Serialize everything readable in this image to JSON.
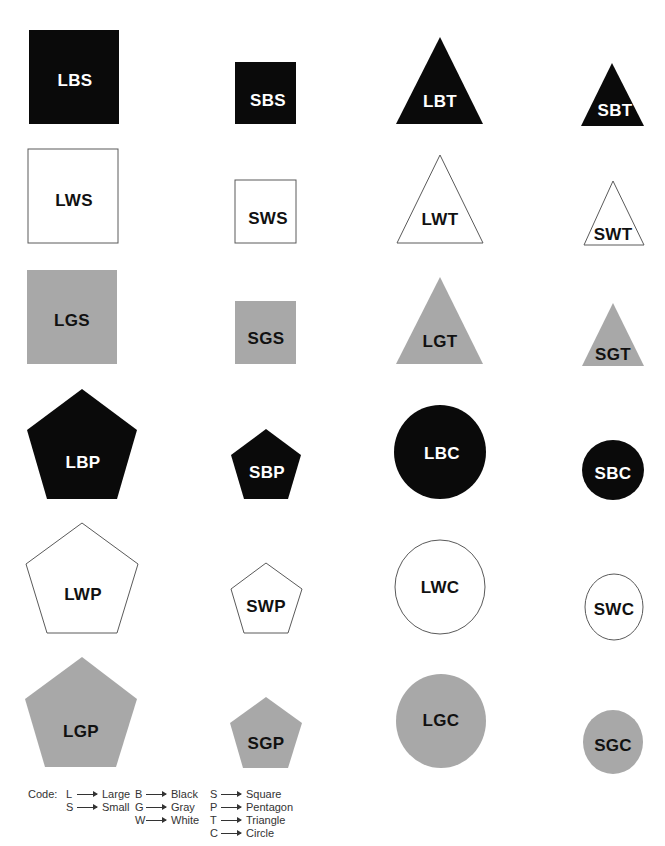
{
  "colors": {
    "black": "#0a0a0a",
    "gray": "#a8a8a8",
    "white": "#ffffff",
    "outline": "#5a5a5a",
    "label_on_dark": "#ffffff",
    "label_on_light": "#111111"
  },
  "shapes": [
    {
      "label": "LBS",
      "kind": "rect",
      "fill": "black",
      "x": 29,
      "y": 30,
      "w": 90,
      "h": 94,
      "lx": 75,
      "ly": 80
    },
    {
      "label": "SBS",
      "kind": "rect",
      "fill": "black",
      "x": 235,
      "y": 62,
      "w": 61,
      "h": 62,
      "lx": 268,
      "ly": 100
    },
    {
      "label": "LBT",
      "kind": "poly",
      "fill": "black",
      "points": "440,37 483,124 396,124",
      "lx": 440,
      "ly": 101
    },
    {
      "label": "SBT",
      "kind": "poly",
      "fill": "black",
      "points": "612,63 644,126 581,126",
      "lx": 615,
      "ly": 110
    },
    {
      "label": "LWS",
      "kind": "rect",
      "fill": "white",
      "x": 28,
      "y": 149,
      "w": 90,
      "h": 94,
      "lx": 74,
      "ly": 200
    },
    {
      "label": "SWS",
      "kind": "rect",
      "fill": "white",
      "x": 235,
      "y": 180,
      "w": 61,
      "h": 63,
      "lx": 268,
      "ly": 218
    },
    {
      "label": "LWT",
      "kind": "poly",
      "fill": "white",
      "points": "440,155 483,243 397,243",
      "lx": 440,
      "ly": 219
    },
    {
      "label": "SWT",
      "kind": "poly",
      "fill": "white",
      "points": "613,181 644,245 584,245",
      "lx": 613,
      "ly": 234
    },
    {
      "label": "LGS",
      "kind": "rect",
      "fill": "gray",
      "x": 27,
      "y": 270,
      "w": 90,
      "h": 94,
      "lx": 72,
      "ly": 320
    },
    {
      "label": "SGS",
      "kind": "rect",
      "fill": "gray",
      "x": 235,
      "y": 301,
      "w": 61,
      "h": 63,
      "lx": 266,
      "ly": 338
    },
    {
      "label": "LGT",
      "kind": "poly",
      "fill": "gray",
      "points": "440,277 483,364 396,364",
      "lx": 440,
      "ly": 341
    },
    {
      "label": "SGT",
      "kind": "poly",
      "fill": "gray",
      "points": "613,303 644,366 582,366",
      "lx": 613,
      "ly": 354
    },
    {
      "label": "LBP",
      "kind": "poly",
      "fill": "black",
      "points": "82,389 137,430 117,499 47,499 27,430",
      "lx": 83,
      "ly": 462
    },
    {
      "label": "SBP",
      "kind": "poly",
      "fill": "black",
      "points": "266,429 301,455 288,499 244,499 231,455",
      "lx": 267,
      "ly": 472
    },
    {
      "label": "LBC",
      "kind": "ellipse",
      "fill": "black",
      "cx": 440,
      "cy": 452,
      "rx": 46,
      "ry": 47,
      "lx": 442,
      "ly": 453
    },
    {
      "label": "SBC",
      "kind": "ellipse",
      "fill": "black",
      "cx": 613,
      "cy": 470,
      "rx": 31,
      "ry": 30,
      "lx": 613,
      "ly": 473
    },
    {
      "label": "LWP",
      "kind": "poly",
      "fill": "white",
      "points": "82,523 138,564 117,633 47,633 26,564",
      "lx": 83,
      "ly": 594
    },
    {
      "label": "SWP",
      "kind": "poly",
      "fill": "white",
      "points": "266,563 302,589 288,633 244,633 231,589",
      "lx": 266,
      "ly": 606
    },
    {
      "label": "LWC",
      "kind": "ellipse",
      "fill": "white",
      "cx": 440,
      "cy": 587,
      "rx": 45,
      "ry": 47,
      "lx": 440,
      "ly": 587
    },
    {
      "label": "SWC",
      "kind": "ellipse",
      "fill": "white",
      "cx": 614,
      "cy": 607,
      "rx": 29,
      "ry": 33,
      "lx": 614,
      "ly": 609
    },
    {
      "label": "LGP",
      "kind": "poly",
      "fill": "gray",
      "points": "82,657 137,699 116,767 45,767 25,699",
      "lx": 81,
      "ly": 731
    },
    {
      "label": "SGP",
      "kind": "poly",
      "fill": "gray",
      "points": "266,697 302,723 288,768 243,768 230,723",
      "lx": 266,
      "ly": 743
    },
    {
      "label": "LGC",
      "kind": "ellipse",
      "fill": "gray",
      "cx": 441,
      "cy": 721,
      "rx": 45,
      "ry": 47,
      "lx": 441,
      "ly": 720
    },
    {
      "label": "SGC",
      "kind": "ellipse",
      "fill": "gray",
      "cx": 613,
      "cy": 742,
      "rx": 30,
      "ry": 32,
      "lx": 613,
      "ly": 745
    }
  ],
  "legend": {
    "title": "Code:",
    "columns": [
      {
        "x": 38,
        "entries": [
          {
            "letter": "L",
            "meaning": "Large"
          },
          {
            "letter": "S",
            "meaning": "Small"
          }
        ]
      },
      {
        "x": 107,
        "entries": [
          {
            "letter": "B",
            "meaning": "Black"
          },
          {
            "letter": "G",
            "meaning": "Gray"
          },
          {
            "letter": "W",
            "meaning": "White"
          }
        ]
      },
      {
        "x": 182,
        "entries": [
          {
            "letter": "S",
            "meaning": "Square"
          },
          {
            "letter": "P",
            "meaning": "Pentagon"
          },
          {
            "letter": "T",
            "meaning": "Triangle"
          },
          {
            "letter": "C",
            "meaning": "Circle"
          }
        ]
      }
    ]
  }
}
